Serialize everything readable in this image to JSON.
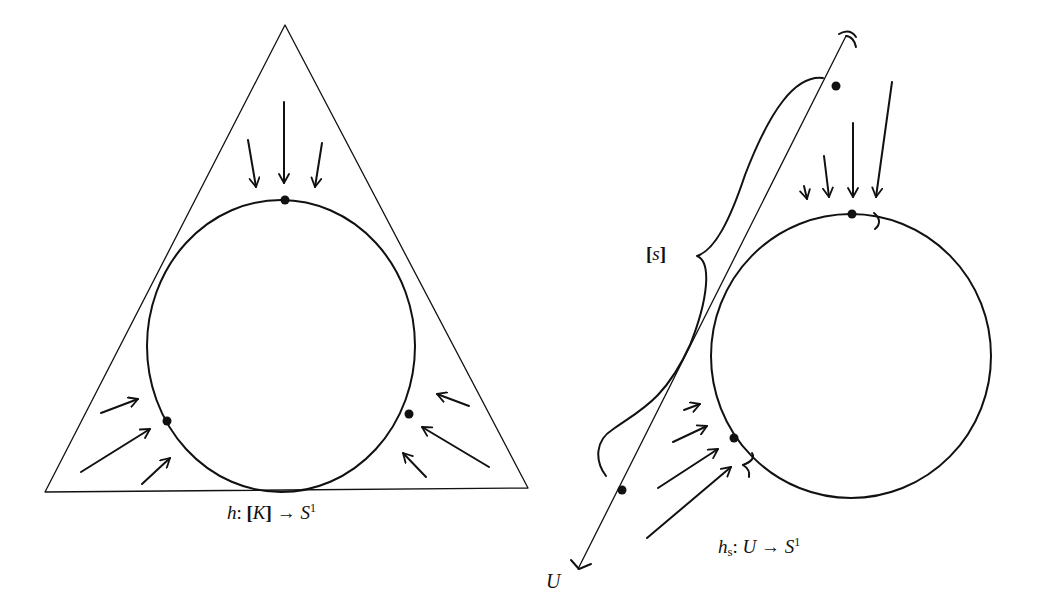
{
  "figure": {
    "left_panel": {
      "label": {
        "func": "h",
        "colon": ":",
        "domain_open": "[",
        "domain": "K",
        "domain_close": "]",
        "arrow": "→",
        "codomain": "S",
        "codomain_sup": "1"
      },
      "shapes": [
        "triangle",
        "inscribed-circle"
      ],
      "points_on_circle": 3,
      "arrow_groups": [
        "top: 3 arrows pointing down",
        "lower-left: 3 arrows pointing up-right",
        "lower-right: 3 arrows pointing up-left"
      ]
    },
    "right_panel": {
      "label": {
        "func": "h",
        "func_sub": "s",
        "colon": ":",
        "domain": "U",
        "arrow": "→",
        "codomain": "S",
        "codomain_sup": "1"
      },
      "line_label": "U",
      "brace_label": {
        "open": "[",
        "var": "s",
        "close": "]"
      },
      "shapes": [
        "line",
        "circle",
        "brace"
      ],
      "arrow_groups": [
        "top: 4 arrows pointing down",
        "lower-left: 4 arrows pointing up-right"
      ]
    },
    "colors": {
      "ink": "#111111",
      "background": "#ffffff"
    }
  }
}
